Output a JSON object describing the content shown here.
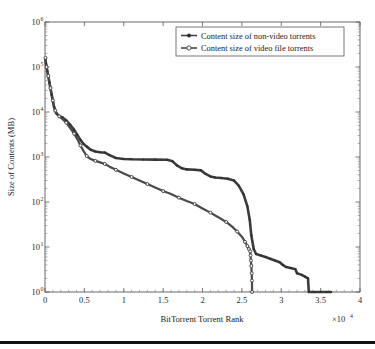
{
  "chart_data": {
    "type": "line",
    "title": "",
    "xlabel": "BitTorrent Torrent Rank",
    "ylabel": "Size of Contents (MB)",
    "x_multiplier": "×10⁴",
    "x_multiplier_base": "×10",
    "x_multiplier_exp": "4",
    "xlim": [
      0,
      40000
    ],
    "ylim": [
      1,
      1000000
    ],
    "yscale": "log",
    "xscale": "linear",
    "grid": false,
    "legend_position": "top-right",
    "xticks": [
      0,
      0.5,
      1,
      1.5,
      2,
      2.5,
      3,
      3.5,
      4
    ],
    "xtick_labels": [
      "0",
      "0.5",
      "1",
      "1.5",
      "2",
      "2.5",
      "3",
      "3.5",
      "4"
    ],
    "yticks": [
      1,
      10,
      100,
      1000,
      10000,
      100000,
      1000000
    ],
    "ytick_labels": [
      "10⁰",
      "10¹",
      "10²",
      "10³",
      "10⁴",
      "10⁵",
      "10⁶"
    ],
    "ytick_bases": [
      "10",
      "10",
      "10",
      "10",
      "10",
      "10",
      "10"
    ],
    "ytick_exps": [
      "0",
      "1",
      "2",
      "3",
      "4",
      "5",
      "6"
    ],
    "series": [
      {
        "name": "Content size of non-video torrents",
        "marker": "filled-dot",
        "color": "#3c3c3c",
        "points": [
          [
            60,
            150000
          ],
          [
            120,
            120000
          ],
          [
            200,
            98000
          ],
          [
            300,
            80000
          ],
          [
            420,
            62000
          ],
          [
            560,
            45000
          ],
          [
            700,
            33000
          ],
          [
            850,
            24000
          ],
          [
            1000,
            17000
          ],
          [
            1150,
            13000
          ],
          [
            1300,
            10500
          ],
          [
            1500,
            9000
          ],
          [
            1800,
            8200
          ],
          [
            2200,
            7600
          ],
          [
            2700,
            6500
          ],
          [
            3200,
            5200
          ],
          [
            3700,
            4000
          ],
          [
            4100,
            3100
          ],
          [
            4500,
            2400
          ],
          [
            4900,
            1950
          ],
          [
            5300,
            1700
          ],
          [
            5800,
            1450
          ],
          [
            6400,
            1320
          ],
          [
            7000,
            1280
          ],
          [
            7600,
            1250
          ],
          [
            8200,
            1100
          ],
          [
            9000,
            950
          ],
          [
            10000,
            905
          ],
          [
            11000,
            890
          ],
          [
            12500,
            880
          ],
          [
            14000,
            875
          ],
          [
            15500,
            870
          ],
          [
            16200,
            800
          ],
          [
            16800,
            640
          ],
          [
            17400,
            560
          ],
          [
            18000,
            530
          ],
          [
            19000,
            520
          ],
          [
            19800,
            505
          ],
          [
            20400,
            420
          ],
          [
            21000,
            370
          ],
          [
            21600,
            350
          ],
          [
            22400,
            340
          ],
          [
            23200,
            330
          ],
          [
            24000,
            300
          ],
          [
            24600,
            230
          ],
          [
            25200,
            150
          ],
          [
            25700,
            80
          ],
          [
            26000,
            40
          ],
          [
            26200,
            18
          ],
          [
            26500,
            9
          ],
          [
            26800,
            7
          ],
          [
            27400,
            6.5
          ],
          [
            28000,
            6
          ],
          [
            28600,
            5.5
          ],
          [
            29200,
            5
          ],
          [
            29800,
            4.6
          ],
          [
            30200,
            4
          ],
          [
            30600,
            3.6
          ],
          [
            31200,
            3.4
          ],
          [
            31800,
            3.2
          ],
          [
            32000,
            2.6
          ],
          [
            32600,
            2.4
          ],
          [
            33000,
            2.2
          ],
          [
            33400,
            2.0
          ],
          [
            33500,
            1.0
          ],
          [
            34200,
            1.0
          ],
          [
            35000,
            1.0
          ],
          [
            35800,
            1.0
          ],
          [
            36300,
            1.0
          ]
        ]
      },
      {
        "name": "Content size of video file torrents",
        "marker": "open-circle",
        "color": "#4a4a4a",
        "points": [
          [
            60,
            160000
          ],
          [
            120,
            125000
          ],
          [
            200,
            100000
          ],
          [
            300,
            82000
          ],
          [
            420,
            63000
          ],
          [
            560,
            46000
          ],
          [
            700,
            34000
          ],
          [
            850,
            25000
          ],
          [
            1000,
            18000
          ],
          [
            1150,
            13500
          ],
          [
            1300,
            10800
          ],
          [
            1500,
            9200
          ],
          [
            1800,
            8000
          ],
          [
            2200,
            7000
          ],
          [
            2700,
            5800
          ],
          [
            3200,
            4400
          ],
          [
            3700,
            3300
          ],
          [
            4100,
            2500
          ],
          [
            4500,
            1800
          ],
          [
            4900,
            1350
          ],
          [
            5300,
            1050
          ],
          [
            5800,
            900
          ],
          [
            6400,
            820
          ],
          [
            7000,
            760
          ],
          [
            7600,
            700
          ],
          [
            8200,
            610
          ],
          [
            9000,
            520
          ],
          [
            10000,
            430
          ],
          [
            11000,
            360
          ],
          [
            12000,
            300
          ],
          [
            13000,
            250
          ],
          [
            14000,
            210
          ],
          [
            15000,
            175
          ],
          [
            16000,
            150
          ],
          [
            17000,
            125
          ],
          [
            18000,
            105
          ],
          [
            19000,
            90
          ],
          [
            20000,
            72
          ],
          [
            21000,
            58
          ],
          [
            22000,
            46
          ],
          [
            23000,
            36
          ],
          [
            23800,
            28
          ],
          [
            24400,
            22
          ],
          [
            25000,
            17
          ],
          [
            25400,
            13
          ],
          [
            25700,
            10.5
          ],
          [
            25900,
            9
          ],
          [
            26050,
            8
          ],
          [
            26100,
            6.5
          ],
          [
            26150,
            5.0
          ],
          [
            26200,
            3.8
          ],
          [
            26250,
            2.6
          ],
          [
            26280,
            1.8
          ],
          [
            26300,
            1.0
          ]
        ]
      }
    ]
  }
}
